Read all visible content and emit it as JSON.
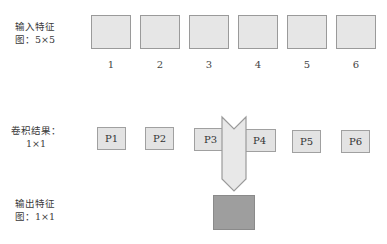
{
  "labels": {
    "input_line1": "输入特征",
    "input_line2": "图：5×5",
    "conv_line1": "卷积结果：",
    "conv_line2": "1×1",
    "output_line1": "输出特征",
    "output_line2": "图：1×1"
  },
  "input_maps": [
    {
      "num": "1"
    },
    {
      "num": "2"
    },
    {
      "num": "3"
    },
    {
      "num": "4"
    },
    {
      "num": "5"
    },
    {
      "num": "6"
    }
  ],
  "conv_results": [
    {
      "label": "P1"
    },
    {
      "label": "P2"
    },
    {
      "label": "P3"
    },
    {
      "label": "P4"
    },
    {
      "label": "P5"
    },
    {
      "label": "P6"
    }
  ],
  "colors": {
    "input_fill": "#e6e6e6",
    "conv_fill": "#e3e3e3",
    "arrow_fill": "#e8e8e8",
    "output_fill": "#9e9e9e",
    "border": "#9a9a9a"
  }
}
